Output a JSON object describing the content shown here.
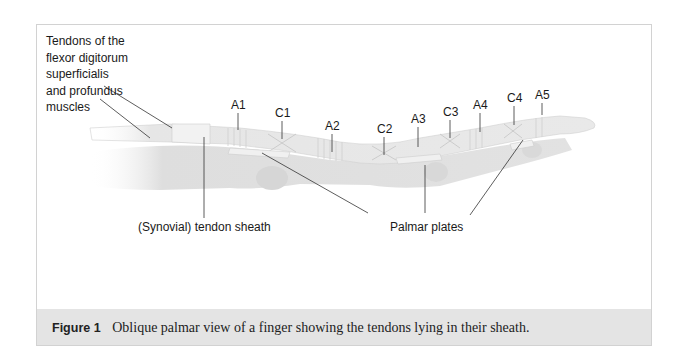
{
  "figure": {
    "number_label": "Figure 1",
    "caption_text": "Oblique palmar view of a finger showing the tendons lying in their sheath."
  },
  "labels": {
    "tendons_line1": "Tendons of the",
    "tendons_line2": "flexor digitorum",
    "tendons_line3": "superficialis",
    "tendons_line4": "and profundus",
    "tendons_line5": "muscles",
    "sheath": "(Synovial) tendon sheath",
    "palmar_plates": "Palmar plates",
    "pulleys": [
      {
        "id": "A1",
        "x": 238,
        "y": 98
      },
      {
        "id": "C1",
        "x": 282,
        "y": 106
      },
      {
        "id": "A2",
        "x": 332,
        "y": 119
      },
      {
        "id": "C2",
        "x": 384,
        "y": 122
      },
      {
        "id": "A3",
        "x": 418,
        "y": 112
      },
      {
        "id": "C3",
        "x": 450,
        "y": 105
      },
      {
        "id": "A4",
        "x": 480,
        "y": 98
      },
      {
        "id": "C4",
        "x": 514,
        "y": 91
      },
      {
        "id": "A5",
        "x": 542,
        "y": 88
      }
    ]
  },
  "colors": {
    "frame_border": "#d2d2d2",
    "caption_bg": "#e4e4e4",
    "leader_line": "#333333",
    "illustration_base": "#e9e9e9"
  }
}
